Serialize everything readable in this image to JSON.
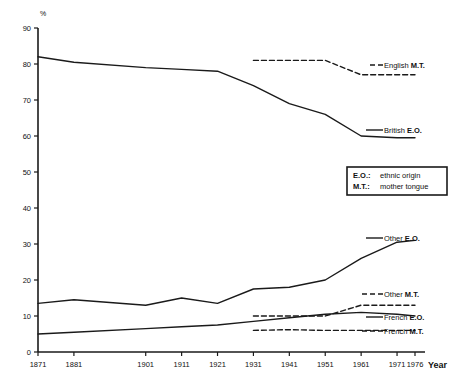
{
  "chart_data": {
    "type": "line",
    "title": "",
    "subtitle": "",
    "xlabel": "Year",
    "ylabel": "%",
    "ylim": [
      0,
      90
    ],
    "xlim": [
      1871,
      1976
    ],
    "grid": false,
    "legend_position": "right-inline",
    "y_ticks": [
      0,
      10,
      20,
      30,
      40,
      50,
      60,
      70,
      80,
      90
    ],
    "x_ticks": [
      1871,
      1881,
      1901,
      1911,
      1921,
      1931,
      1941,
      1951,
      1961,
      1971,
      1976
    ],
    "x_tick_labels": [
      "1871",
      "1881",
      "1901",
      "1911",
      "1921",
      "1931",
      "1941",
      "1951",
      "1961",
      "1971",
      "1976"
    ],
    "series": [
      {
        "name": "British E.O.",
        "style": "solid",
        "color": "#1a1a1a",
        "label": "British E.O.",
        "label_prefix": "British ",
        "label_bold": "E.O.",
        "x": [
          1871,
          1881,
          1901,
          1911,
          1921,
          1931,
          1941,
          1951,
          1961,
          1971,
          1976
        ],
        "values": [
          82,
          80.5,
          79,
          78.5,
          78,
          74,
          69,
          66,
          60,
          59.5,
          59.5
        ]
      },
      {
        "name": "English M.T.",
        "style": "dashed",
        "color": "#1a1a1a",
        "label": "English M.T.",
        "label_prefix": "English ",
        "label_bold": "M.T.",
        "x": [
          1931,
          1941,
          1951,
          1961,
          1971,
          1976
        ],
        "values": [
          81,
          81,
          81,
          77,
          77,
          77
        ]
      },
      {
        "name": "Other E.O.",
        "style": "solid",
        "color": "#1a1a1a",
        "label": "Other E.O.",
        "label_prefix": "Other ",
        "label_bold": "E.O.",
        "x": [
          1871,
          1881,
          1901,
          1911,
          1921,
          1931,
          1941,
          1951,
          1961,
          1971,
          1976
        ],
        "values": [
          13.5,
          14.5,
          13,
          15,
          13.5,
          17.5,
          18,
          20,
          26,
          30.5,
          31
        ]
      },
      {
        "name": "Other M.T.",
        "style": "dashed",
        "color": "#1a1a1a",
        "label": "Other M.T.",
        "label_prefix": "Other ",
        "label_bold": "M.T.",
        "x": [
          1931,
          1941,
          1951,
          1961,
          1971,
          1976
        ],
        "values": [
          10,
          10,
          10,
          13,
          13,
          13
        ]
      },
      {
        "name": "French E.O.",
        "style": "solid",
        "color": "#1a1a1a",
        "label": "French E.O.",
        "label_prefix": "French ",
        "label_bold": "E.O.",
        "x": [
          1871,
          1881,
          1901,
          1911,
          1921,
          1931,
          1941,
          1951,
          1961,
          1971,
          1976
        ],
        "values": [
          5,
          5.5,
          6.5,
          7,
          7.5,
          8.5,
          9.5,
          10.5,
          11,
          10.5,
          10
        ]
      },
      {
        "name": "French M.T.",
        "style": "dashed",
        "color": "#1a1a1a",
        "label": "French M.T.",
        "label_prefix": "French ",
        "label_bold": "M.T.",
        "x": [
          1931,
          1941,
          1951,
          1961,
          1971,
          1976
        ],
        "values": [
          6,
          6.2,
          6,
          6,
          6,
          6
        ]
      }
    ],
    "annotations": [
      {
        "key": "eo",
        "abbrev": "E.O.:",
        "text": "ethnic origin"
      },
      {
        "key": "mt",
        "abbrev": "M.T.:",
        "text": "mother tongue"
      }
    ]
  },
  "axis": {
    "y_unit": "%",
    "x_title": "Year"
  },
  "legend_box": {
    "row1_abbrev": "E.O.:",
    "row1_text": "ethnic origin",
    "row2_abbrev": "M.T.:",
    "row2_text": "mother tongue"
  }
}
